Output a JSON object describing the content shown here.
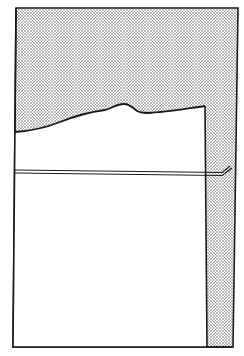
{
  "diagram": {
    "colors": {
      "background": "#ffffff",
      "stroke": "#1a1a1a",
      "stipple_dot": "#555555"
    },
    "outer_frame": {
      "points": [
        [
          16,
          8
        ],
        [
          238,
          8
        ],
        [
          233,
          347
        ],
        [
          13,
          347
        ]
      ]
    },
    "white_region_top_edge": [
      [
        15,
        132
      ],
      [
        30,
        130
      ],
      [
        50,
        126
      ],
      [
        70,
        118
      ],
      [
        90,
        113
      ],
      [
        105,
        110
      ],
      [
        115,
        105
      ],
      [
        124,
        104
      ],
      [
        130,
        105
      ],
      [
        136,
        111
      ],
      [
        142,
        113
      ],
      [
        160,
        112
      ],
      [
        180,
        110
      ],
      [
        205,
        106
      ]
    ],
    "white_region_right_edge_x": 205,
    "rail": {
      "y_start": 171,
      "y_end": 174,
      "x_start": 15,
      "x_end": 222,
      "hook_end": [
        232,
        166
      ]
    }
  }
}
